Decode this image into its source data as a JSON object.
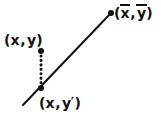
{
  "figure": {
    "kind": "regression-residual-diagram",
    "width": 161,
    "height": 118,
    "background_color": "#ffffff",
    "ink_color": "#111111"
  },
  "labels": {
    "mean_point": {
      "name": "mean-point-label",
      "text": "(x̄,ȳ)",
      "open_paren": "(",
      "x_symbol": "x",
      "comma": ",",
      "y_symbol": "y",
      "close_paren": ")",
      "x_has_overbar": true,
      "y_has_overbar": true
    },
    "observed_point": {
      "name": "observed-point-label",
      "text": "(x,y)",
      "open_paren": "(",
      "x_symbol": "x",
      "comma": ",",
      "y_symbol": "y",
      "close_paren": ")"
    },
    "predicted_point": {
      "name": "predicted-point-label",
      "text": "(x,y')",
      "open_paren": "(",
      "x_symbol": "x",
      "comma": ",",
      "y_symbol": "y",
      "prime": "′",
      "close_paren": ")"
    }
  },
  "chart_data": {
    "type": "scatter",
    "title": "",
    "subtitle": "",
    "xlabel": "",
    "ylabel": "",
    "grid": false,
    "legend": "none",
    "axes_visible": false,
    "xlim": [
      0,
      161
    ],
    "ylim": [
      0,
      118
    ],
    "note": "Coordinates are in screenshot pixel space, y increasing downward.",
    "regression_line": {
      "name": "regression-line",
      "style": "solid",
      "color": "#111111",
      "width": 2.0,
      "x1": 23,
      "y1": 105,
      "x2": 111,
      "y2": 13
    },
    "residual_segment": {
      "name": "residual-dotted-segment",
      "style": "dotted",
      "color": "#111111",
      "width": 3.0,
      "dot_count": 9,
      "x1": 41,
      "y1": 51,
      "x2": 41,
      "y2": 88
    },
    "points": [
      {
        "name": "mean-point",
        "label": "(x̄,ȳ)",
        "x": 111,
        "y": 13,
        "radius": 3.0,
        "color": "#111111",
        "on_line": true
      },
      {
        "name": "observed-point",
        "label": "(x,y)",
        "x": 41,
        "y": 51,
        "radius": 3.0,
        "color": "#111111",
        "on_line": false
      },
      {
        "name": "predicted-point",
        "label": "(x,y')",
        "x": 41,
        "y": 88,
        "radius": 3.0,
        "color": "#111111",
        "on_line": true
      }
    ]
  }
}
